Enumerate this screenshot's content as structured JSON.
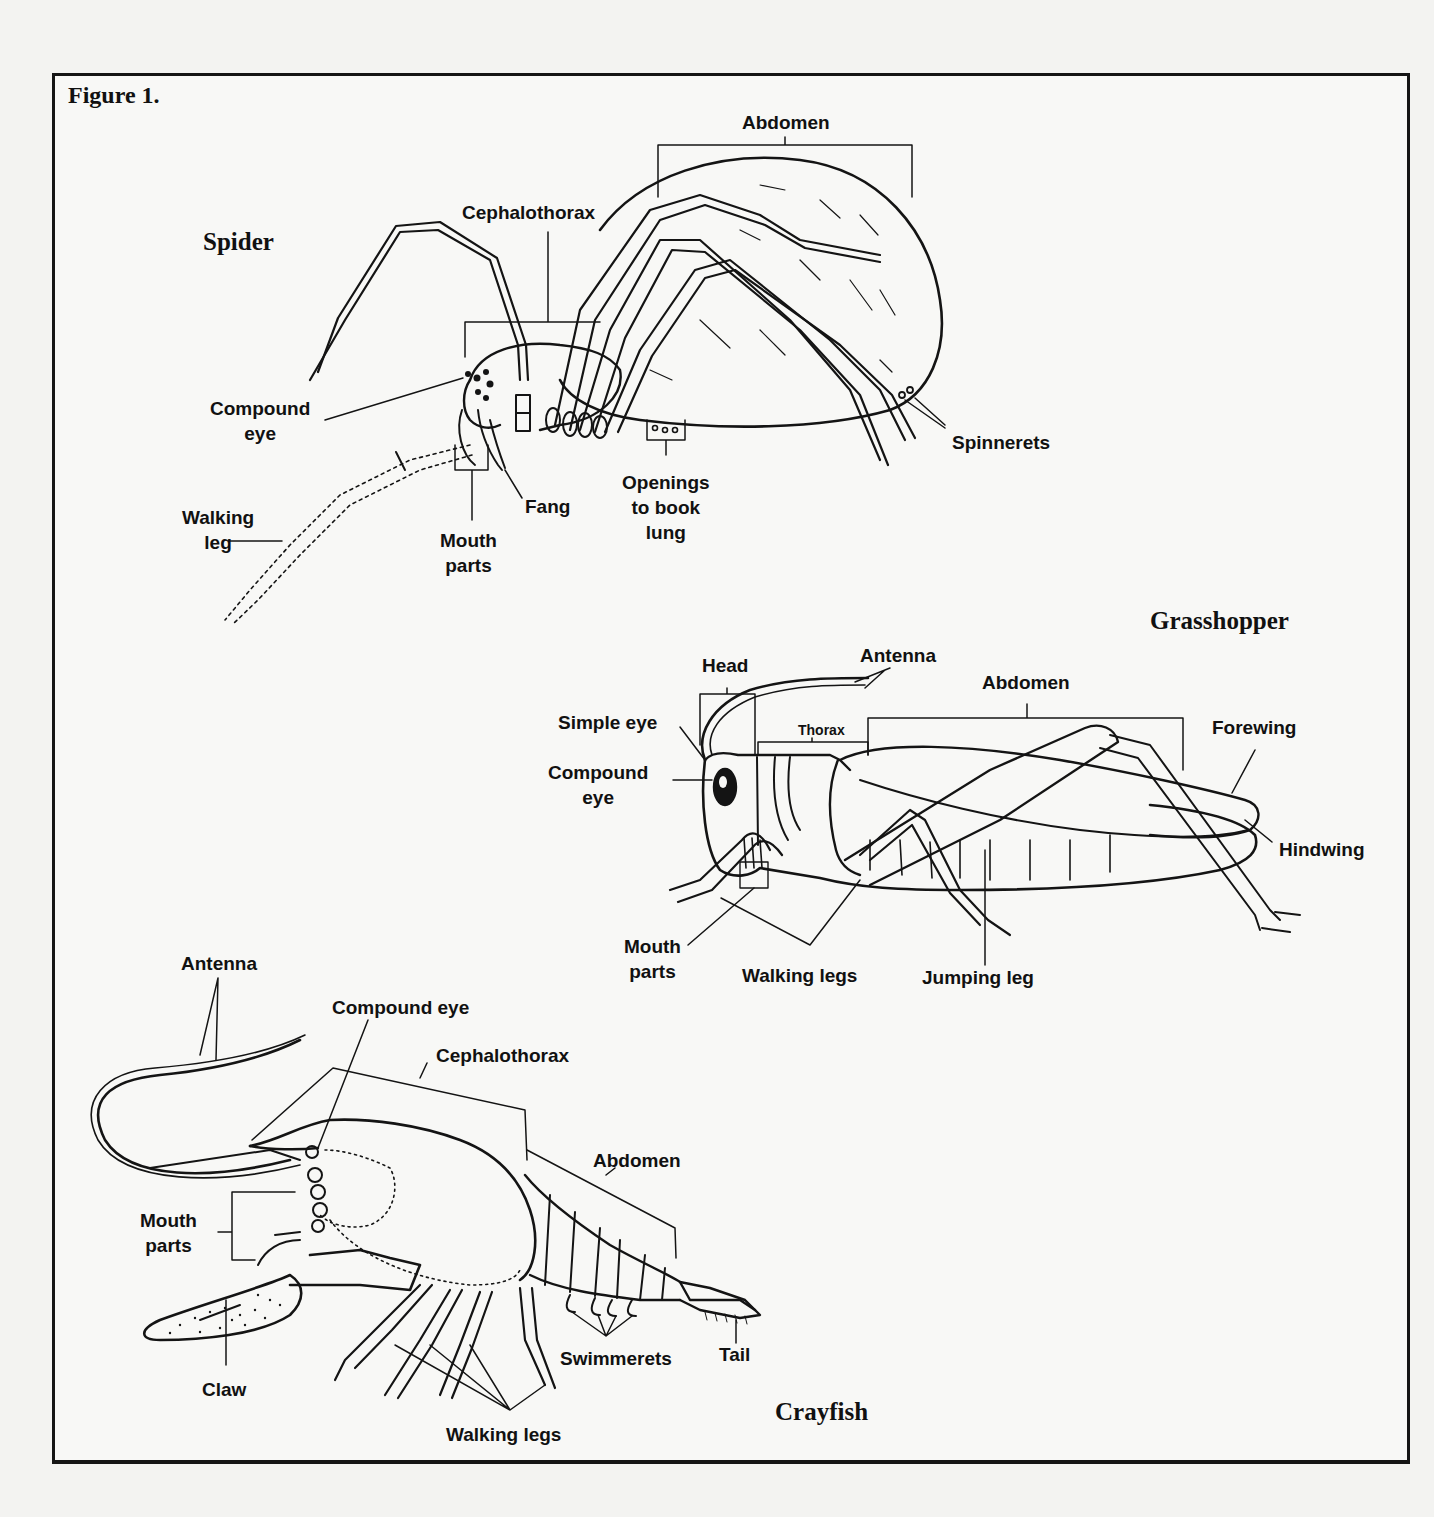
{
  "figure": {
    "title": "Figure 1.",
    "border_color": "#151515",
    "background": "#f8f8f6"
  },
  "spider": {
    "name": "Spider",
    "labels": {
      "abdomen": "Abdomen",
      "cephalothorax": "Cephalothorax",
      "compound_eye": "Compound\neye",
      "spinnerets": "Spinnerets",
      "fang": "Fang",
      "openings_book_lung": "Openings\nto book\nlung",
      "walking_leg": "Walking\nleg",
      "mouth_parts": "Mouth\nparts"
    }
  },
  "grasshopper": {
    "name": "Grasshopper",
    "labels": {
      "head": "Head",
      "antenna": "Antenna",
      "abdomen": "Abdomen",
      "thorax": "Thorax",
      "simple_eye": "Simple eye",
      "compound_eye": "Compound\neye",
      "forewing": "Forewing",
      "hindwing": "Hindwing",
      "mouth_parts": "Mouth\nparts",
      "walking_legs": "Walking legs",
      "jumping_leg": "Jumping leg"
    }
  },
  "crayfish": {
    "name": "Crayfish",
    "labels": {
      "antenna": "Antenna",
      "compound_eye": "Compound eye",
      "cephalothorax": "Cephalothorax",
      "abdomen": "Abdomen",
      "mouth_parts": "Mouth\nparts",
      "claw": "Claw",
      "swimmerets": "Swimmerets",
      "tail": "Tail",
      "walking_legs": "Walking legs"
    }
  }
}
